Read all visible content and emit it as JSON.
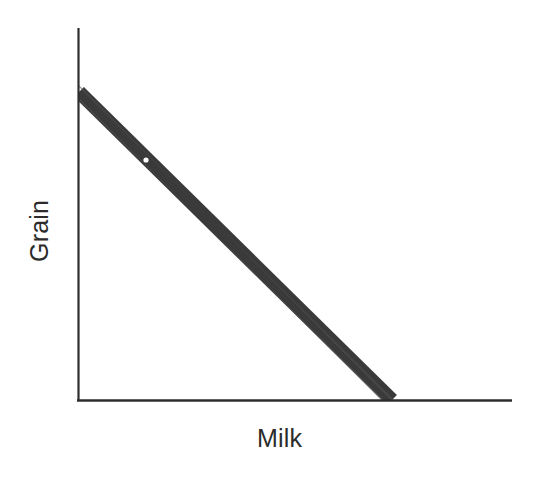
{
  "chart_data": {
    "type": "line",
    "title": "",
    "subtitle": "",
    "xlabel": "Milk",
    "ylabel": "Grain",
    "grid": false,
    "legend": null,
    "xlim": [
      0,
      1
    ],
    "ylim": [
      0,
      1
    ],
    "x_tick_labels": [],
    "y_tick_labels": [],
    "annotations": [],
    "series": [
      {
        "name": "Production possibilities frontier",
        "style": "thick-solid-band",
        "color": "#3a3a3a",
        "x": [
          0,
          1
        ],
        "y": [
          1,
          0
        ],
        "points_pixel": [
          {
            "x": 79,
            "y": 92
          },
          {
            "x": 392,
            "y": 400
          }
        ]
      }
    ],
    "markers": [
      {
        "name": "interior-point",
        "color": "#ffffff",
        "x": 0.21,
        "y": 0.79,
        "pixel": {
          "x": 146,
          "y": 160
        },
        "radius": 2.6
      }
    ]
  },
  "axes": {
    "y_axis": {
      "name": "vertical-axis",
      "color": "#2e2e2e",
      "x": 78.5,
      "y_top": 28,
      "y_bottom": 401,
      "width": 2.2
    },
    "x_axis": {
      "name": "horizontal-axis",
      "color": "#2e2e2e",
      "y": 400.5,
      "x_left": 77,
      "x_right": 512,
      "width": 2.4
    }
  },
  "labels": {
    "y_axis_label": "Grain",
    "x_axis_label": "Milk"
  },
  "colors": {
    "background": "#ffffff",
    "axis": "#2e2e2e",
    "line": "#3a3a3a",
    "text": "#2b2b2b",
    "marker": "#ffffff"
  }
}
